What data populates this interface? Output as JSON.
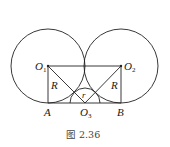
{
  "figure": {
    "caption": "图 2.36",
    "points": {
      "O1": {
        "label": "O",
        "sub": "1",
        "x": 48,
        "y": 66
      },
      "O2": {
        "label": "O",
        "sub": "2",
        "x": 121,
        "y": 66
      },
      "O3": {
        "label": "O",
        "sub": "3",
        "x": 85,
        "y": 103
      },
      "A": {
        "label": "A",
        "x": 48,
        "y": 103
      },
      "B": {
        "label": "B",
        "x": 121,
        "y": 103
      }
    },
    "labels": {
      "R_left": "R",
      "R_right": "R",
      "r": "r"
    },
    "circles": [
      {
        "name": "circle-O1",
        "cx": 48,
        "cy": 66,
        "r": 37
      },
      {
        "name": "circle-O2",
        "cx": 121,
        "cy": 66,
        "r": 37
      }
    ],
    "small_arc": {
      "cx": 85,
      "cy": 103,
      "r": 15
    },
    "stroke_color": "#222222"
  }
}
